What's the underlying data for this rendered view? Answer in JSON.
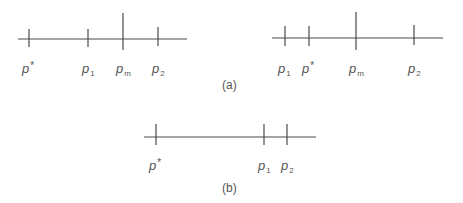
{
  "panels": [
    {
      "id": "a-left",
      "line": {
        "x1": 18,
        "x2": 187,
        "y": 39
      },
      "ticks": [
        {
          "name": "p-star",
          "x": 29,
          "y1": 29,
          "y2": 47,
          "label_base": "p",
          "label_sup": "*",
          "label_sub": "",
          "label_x": 22
        },
        {
          "name": "p1",
          "x": 88,
          "y1": 29,
          "y2": 47,
          "label_base": "p",
          "label_sup": "",
          "label_sub": "1",
          "label_x": 82
        },
        {
          "name": "pm",
          "x": 123,
          "y1": 13,
          "y2": 50,
          "label_base": "p",
          "label_sup": "",
          "label_sub": "m",
          "label_x": 116
        },
        {
          "name": "p2",
          "x": 158,
          "y1": 27,
          "y2": 46,
          "label_base": "p",
          "label_sup": "",
          "label_sub": "2",
          "label_x": 152
        }
      ],
      "label_y": 73
    },
    {
      "id": "a-right",
      "line": {
        "x1": 272,
        "x2": 443,
        "y": 38
      },
      "ticks": [
        {
          "name": "p1",
          "x": 285,
          "y1": 26,
          "y2": 46,
          "label_base": "p",
          "label_sup": "",
          "label_sub": "1",
          "label_x": 278
        },
        {
          "name": "p-star",
          "x": 309,
          "y1": 26,
          "y2": 46,
          "label_base": "p",
          "label_sup": "*",
          "label_sub": "",
          "label_x": 302
        },
        {
          "name": "pm",
          "x": 356,
          "y1": 12,
          "y2": 50,
          "label_base": "p",
          "label_sup": "",
          "label_sub": "m",
          "label_x": 349
        },
        {
          "name": "p2",
          "x": 414,
          "y1": 25,
          "y2": 45,
          "label_base": "p",
          "label_sup": "",
          "label_sub": "2",
          "label_x": 408
        }
      ],
      "label_y": 73
    },
    {
      "id": "b",
      "line": {
        "x1": 144,
        "x2": 316,
        "y": 137
      },
      "ticks": [
        {
          "name": "p-star",
          "x": 156,
          "y1": 124,
          "y2": 145,
          "label_base": "p",
          "label_sup": "*",
          "label_sub": "",
          "label_x": 149
        },
        {
          "name": "p1",
          "x": 264,
          "y1": 124,
          "y2": 145,
          "label_base": "p",
          "label_sup": "",
          "label_sub": "1",
          "label_x": 258
        },
        {
          "name": "p2",
          "x": 287,
          "y1": 124,
          "y2": 145,
          "label_base": "p",
          "label_sup": "",
          "label_sub": "2",
          "label_x": 281
        }
      ],
      "label_y": 170
    }
  ],
  "captions": {
    "a": {
      "text": "(a)",
      "x": 222,
      "y": 89
    },
    "b": {
      "text": "(b)",
      "x": 222,
      "y": 192
    }
  }
}
